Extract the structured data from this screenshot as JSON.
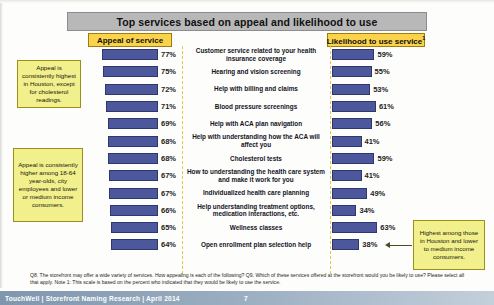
{
  "header": {
    "title": "Top services based on appeal and likelihood to use",
    "left_column_label": "Appeal of service",
    "right_column_label": "Likelihood to use service",
    "right_column_superscript": "1"
  },
  "callouts": {
    "appeal_houston": "Appeal is consistently highest in Houston, except for cholesterol readings.",
    "appeal_demo": "Appeal is consistently higher among 18-64 year-olds, city employees and lower or medium income consumers.",
    "likelihood_houston": "Highest among those in Houston and lower to medium income consumers."
  },
  "footnote": "Q8. The storefront may offer a wide variety of services. How appealing is each of the following? Q9. Which of these services offered at the storefront would  you be likely to use? Please select all that apply. Note 1: This scale is based on the percent who indicated that they would be likely to use the service.",
  "footer": {
    "brand": "TouchWell | Storefront Naming Research | April 2014",
    "page": "7"
  },
  "colors": {
    "bar": "#4d579b",
    "title_bar": "#b8b8b8",
    "column_label": "#fbd34a",
    "callout": "#f2f08c"
  },
  "chart_data": {
    "type": "bar",
    "title": "Top services based on appeal and likelihood to use",
    "xlabel": "",
    "ylabel": "",
    "xlim": [
      0,
      100
    ],
    "grid": false,
    "legend_position": "top",
    "orientation": "horizontal-diverging",
    "categories": [
      "Customer service related to your health insurance coverage",
      "Hearing and vision screening",
      "Help with billing and claims",
      "Blood pressure screenings",
      "Help with ACA plan navigation",
      "Help with understanding how the ACA will affect you",
      "Cholesterol tests",
      "How to understanding the health care system and make it work for you",
      "Individualized health care planning",
      "Help understanding treatment options, medication interactions, etc.",
      "Wellness classes",
      "Open enrollment plan selection help"
    ],
    "series": [
      {
        "name": "Appeal of service",
        "values": [
          77,
          75,
          72,
          71,
          69,
          68,
          68,
          67,
          67,
          66,
          65,
          64
        ],
        "value_labels": [
          "77%",
          "75%",
          "72%",
          "71%",
          "69%",
          "68%",
          "68%",
          "67%",
          "67%",
          "66%",
          "65%",
          "64%"
        ]
      },
      {
        "name": "Likelihood to use service",
        "values": [
          59,
          55,
          53,
          61,
          56,
          41,
          59,
          41,
          49,
          34,
          63,
          38
        ],
        "value_labels": [
          "59%",
          "55%",
          "53%",
          "61%",
          "56%",
          "41%",
          "59%",
          "41%",
          "49%",
          "34%",
          "63%",
          "38%"
        ]
      }
    ]
  }
}
